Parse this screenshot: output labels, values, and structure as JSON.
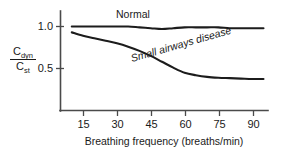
{
  "chart_data": {
    "type": "line",
    "title": "",
    "xlabel": "Breathing frequency (breaths/min)",
    "ylabel": "Cdyn / Cst",
    "ylabel_numerator": "C",
    "ylabel_numerator_sub": "dyn",
    "ylabel_denominator": "C",
    "ylabel_denominator_sub": "st",
    "xlim": [
      5,
      97
    ],
    "ylim": [
      0,
      1.12
    ],
    "xticks": [
      15,
      30,
      45,
      60,
      75,
      90
    ],
    "xtick_labels": [
      "15",
      "30",
      "45",
      "60",
      "75",
      "90"
    ],
    "yticks": [
      0.5,
      1.0
    ],
    "ytick_labels": [
      "0.5",
      "1.0"
    ],
    "grid": false,
    "legend_position": "inline-annotations",
    "series": [
      {
        "name": "Normal",
        "label": "Normal",
        "color": "#1c1c1c",
        "style": "italic-label-no",
        "x": [
          10,
          15,
          20,
          25,
          30,
          35,
          40,
          45,
          50,
          55,
          60,
          65,
          70,
          75,
          80,
          85,
          90,
          95
        ],
        "values": [
          1.0,
          1.0,
          1.0,
          1.0,
          1.0,
          1.0,
          0.99,
          0.98,
          0.97,
          0.98,
          0.99,
          0.99,
          0.99,
          0.99,
          0.98,
          0.98,
          0.98,
          0.98
        ]
      },
      {
        "name": "Small airways disease",
        "label": "Small airways disease",
        "color": "#1c1c1c",
        "style": "italic-label-yes",
        "x": [
          10,
          15,
          20,
          25,
          30,
          35,
          40,
          45,
          50,
          55,
          60,
          65,
          70,
          75,
          80,
          85,
          90,
          95
        ],
        "values": [
          0.93,
          0.89,
          0.86,
          0.83,
          0.8,
          0.76,
          0.71,
          0.65,
          0.58,
          0.51,
          0.45,
          0.42,
          0.4,
          0.39,
          0.385,
          0.38,
          0.375,
          0.375
        ]
      }
    ],
    "annotations": [
      {
        "text": "Normal",
        "x": 42,
        "y": 1.08,
        "italic": false
      },
      {
        "text": "Small airways disease",
        "x": 52,
        "y": 0.68,
        "italic": true,
        "rotation": -16
      }
    ]
  }
}
